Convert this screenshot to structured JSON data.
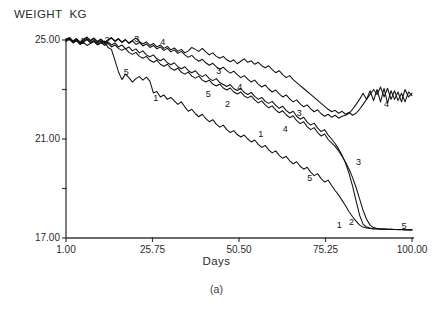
{
  "chart_data": {
    "type": "line",
    "title": "",
    "ylabel": "WEIGHT  KG",
    "xlabel": "Days",
    "caption": "(a)",
    "xlim": [
      1.0,
      100.0
    ],
    "ylim": [
      17.0,
      25.0
    ],
    "xticks": [
      1.0,
      25.75,
      50.5,
      75.25,
      100.0
    ],
    "xtick_labels": [
      "1.00",
      "25.75",
      "50.50",
      "75.25",
      "100.00"
    ],
    "yticks": [
      17.0,
      19.0,
      21.0,
      23.0,
      25.0
    ],
    "ytick_labels": [
      "17.00",
      "",
      "21.00",
      "",
      "25.00"
    ],
    "grid": false,
    "legend": "inline-series-number-labels",
    "line_color": "#111111",
    "background": "#ffffff",
    "series": [
      {
        "name": "1",
        "label": "1",
        "label_points": [
          [
            5.0,
            24.82
          ],
          [
            26.0,
            22.55
          ],
          [
            56.0,
            21.1
          ],
          [
            78.5,
            17.42
          ]
        ],
        "x": [
          1,
          2,
          3,
          4,
          5,
          6,
          7,
          8,
          9,
          10,
          11,
          12,
          13,
          14,
          15,
          16,
          17,
          18,
          19,
          20,
          21,
          22,
          23,
          24,
          25,
          26,
          27,
          28,
          29,
          30,
          31,
          32,
          33,
          34,
          35,
          36,
          37,
          38,
          39,
          40,
          41,
          42,
          43,
          44,
          45,
          46,
          47,
          48,
          49,
          50,
          51,
          52,
          53,
          54,
          55,
          56,
          57,
          58,
          59,
          60,
          61,
          62,
          63,
          64,
          65,
          66,
          67,
          68,
          69,
          70,
          71,
          72,
          73,
          74,
          75,
          76,
          77,
          78,
          79,
          80,
          81,
          82,
          83,
          84,
          85,
          86,
          87,
          88,
          89,
          90,
          91,
          92,
          93,
          94,
          95,
          96,
          97,
          98,
          99,
          100
        ],
        "y": [
          24.95,
          25.02,
          24.88,
          24.97,
          24.82,
          24.9,
          24.78,
          24.86,
          24.94,
          24.8,
          24.88,
          24.96,
          24.7,
          24.62,
          24.18,
          23.72,
          23.4,
          23.62,
          23.48,
          23.3,
          23.44,
          23.52,
          23.38,
          23.5,
          23.34,
          22.86,
          22.92,
          22.7,
          22.78,
          22.6,
          22.68,
          22.54,
          22.4,
          22.5,
          22.3,
          22.12,
          22.2,
          22.02,
          21.9,
          22.0,
          21.82,
          21.7,
          21.78,
          21.6,
          21.48,
          21.56,
          21.38,
          21.26,
          21.34,
          21.18,
          21.08,
          21.16,
          21.0,
          20.88,
          20.96,
          20.78,
          20.66,
          20.74,
          20.56,
          20.44,
          20.52,
          20.34,
          20.22,
          20.3,
          20.12,
          20.0,
          20.08,
          19.9,
          19.78,
          19.86,
          19.66,
          19.52,
          19.6,
          19.4,
          19.26,
          19.34,
          19.12,
          18.92,
          18.74,
          18.52,
          18.3,
          18.06,
          17.86,
          17.68,
          17.52,
          17.44,
          17.4,
          17.38,
          17.36,
          17.36,
          17.35,
          17.35,
          17.34,
          17.34,
          17.34,
          17.33,
          17.33,
          17.33,
          17.32,
          17.32
        ]
      },
      {
        "name": "2",
        "label": "2",
        "label_points": [
          [
            12.0,
            24.88
          ],
          [
            46.5,
            22.3
          ],
          [
            82.0,
            17.52
          ]
        ],
        "x": [
          1,
          2,
          3,
          4,
          5,
          6,
          7,
          8,
          9,
          10,
          11,
          12,
          13,
          14,
          15,
          16,
          17,
          18,
          19,
          20,
          21,
          22,
          23,
          24,
          25,
          26,
          27,
          28,
          29,
          30,
          31,
          32,
          33,
          34,
          35,
          36,
          37,
          38,
          39,
          40,
          41,
          42,
          43,
          44,
          45,
          46,
          47,
          48,
          49,
          50,
          51,
          52,
          53,
          54,
          55,
          56,
          57,
          58,
          59,
          60,
          61,
          62,
          63,
          64,
          65,
          66,
          67,
          68,
          69,
          70,
          71,
          72,
          73,
          74,
          75,
          76,
          77,
          78,
          79,
          80,
          81,
          82,
          83,
          84,
          85,
          86,
          87,
          88,
          89,
          90,
          91,
          92,
          93,
          94,
          95,
          96,
          97,
          98,
          99,
          100
        ],
        "y": [
          24.98,
          25.06,
          24.92,
          25.0,
          24.86,
          24.94,
          25.04,
          24.9,
          24.98,
          24.88,
          24.96,
          24.84,
          24.92,
          24.8,
          24.88,
          24.72,
          24.8,
          24.64,
          24.72,
          24.56,
          24.64,
          24.48,
          24.56,
          24.4,
          24.32,
          24.4,
          24.24,
          24.16,
          24.24,
          24.08,
          24.0,
          24.08,
          23.92,
          23.84,
          23.92,
          23.76,
          23.68,
          23.76,
          23.6,
          23.52,
          23.6,
          23.44,
          23.36,
          23.44,
          23.28,
          23.2,
          23.12,
          23.2,
          23.04,
          22.96,
          23.04,
          22.88,
          22.8,
          22.88,
          22.72,
          22.6,
          22.68,
          22.52,
          22.44,
          22.52,
          22.36,
          22.24,
          22.32,
          22.16,
          22.04,
          22.12,
          21.92,
          21.8,
          21.88,
          21.68,
          21.56,
          21.64,
          21.44,
          21.3,
          21.38,
          21.16,
          21.0,
          20.82,
          20.6,
          20.34,
          20.02,
          19.6,
          19.1,
          18.5,
          17.92,
          17.56,
          17.44,
          17.4,
          17.38,
          17.37,
          17.36,
          17.36,
          17.35,
          17.35,
          17.34,
          17.34,
          17.34,
          17.33,
          17.33,
          17.33
        ]
      },
      {
        "name": "3",
        "label": "3",
        "label_points": [
          [
            20.5,
            24.92
          ],
          [
            44.0,
            23.62
          ],
          [
            67.0,
            21.92
          ],
          [
            84.0,
            19.96
          ]
        ],
        "x": [
          1,
          2,
          3,
          4,
          5,
          6,
          7,
          8,
          9,
          10,
          11,
          12,
          13,
          14,
          15,
          16,
          17,
          18,
          19,
          20,
          21,
          22,
          23,
          24,
          25,
          26,
          27,
          28,
          29,
          30,
          31,
          32,
          33,
          34,
          35,
          36,
          37,
          38,
          39,
          40,
          41,
          42,
          43,
          44,
          45,
          46,
          47,
          48,
          49,
          50,
          51,
          52,
          53,
          54,
          55,
          56,
          57,
          58,
          59,
          60,
          61,
          62,
          63,
          64,
          65,
          66,
          67,
          68,
          69,
          70,
          71,
          72,
          73,
          74,
          75,
          76,
          77,
          78,
          79,
          80,
          81,
          82,
          83,
          84,
          85,
          86,
          87,
          88,
          89,
          90,
          91,
          92,
          93,
          94,
          95,
          96,
          97,
          98,
          99,
          100
        ],
        "y": [
          25.02,
          25.1,
          24.96,
          25.06,
          24.92,
          25.02,
          25.12,
          24.98,
          25.08,
          24.94,
          25.04,
          24.9,
          25.0,
          25.1,
          24.96,
          25.06,
          24.92,
          25.02,
          24.88,
          24.98,
          25.08,
          24.94,
          24.84,
          24.92,
          24.78,
          24.86,
          24.72,
          24.8,
          24.66,
          24.74,
          24.6,
          24.68,
          24.54,
          24.62,
          24.48,
          24.56,
          24.7,
          24.62,
          24.54,
          24.66,
          24.52,
          24.4,
          24.48,
          24.34,
          24.26,
          24.34,
          24.2,
          24.12,
          24.2,
          24.04,
          24.14,
          24.24,
          24.1,
          24.16,
          24.02,
          24.1,
          23.96,
          23.88,
          23.96,
          23.8,
          23.68,
          23.76,
          23.6,
          23.48,
          23.56,
          23.4,
          23.28,
          23.16,
          23.04,
          22.92,
          22.8,
          22.68,
          22.56,
          22.44,
          22.32,
          22.2,
          22.1,
          22.16,
          22.04,
          22.12,
          22.0,
          22.08,
          21.96,
          22.04,
          22.2,
          22.4,
          22.6,
          22.8,
          23.0,
          22.8,
          23.1,
          22.7,
          23.05,
          22.6,
          22.95,
          22.55,
          22.85,
          22.5,
          22.9,
          22.75
        ]
      },
      {
        "name": "4",
        "label": "4",
        "label_points": [
          [
            28.0,
            24.8
          ],
          [
            50.0,
            23.0
          ],
          [
            63.0,
            21.3
          ],
          [
            92.0,
            22.3
          ]
        ],
        "x": [
          1,
          2,
          3,
          4,
          5,
          6,
          7,
          8,
          9,
          10,
          11,
          12,
          13,
          14,
          15,
          16,
          17,
          18,
          19,
          20,
          21,
          22,
          23,
          24,
          25,
          26,
          27,
          28,
          29,
          30,
          31,
          32,
          33,
          34,
          35,
          36,
          37,
          38,
          39,
          40,
          41,
          42,
          43,
          44,
          45,
          46,
          47,
          48,
          49,
          50,
          51,
          52,
          53,
          54,
          55,
          56,
          57,
          58,
          59,
          60,
          61,
          62,
          63,
          64,
          65,
          66,
          67,
          68,
          69,
          70,
          71,
          72,
          73,
          74,
          75,
          76,
          77,
          78,
          79,
          80,
          81,
          82,
          83,
          84,
          85,
          86,
          87,
          88,
          89,
          90,
          91,
          92,
          93,
          94,
          95,
          96,
          97,
          98,
          99,
          100
        ],
        "y": [
          25.0,
          25.08,
          24.94,
          25.04,
          24.9,
          25.0,
          25.1,
          24.96,
          25.06,
          24.92,
          25.02,
          24.88,
          24.98,
          25.08,
          24.94,
          25.04,
          24.9,
          25.0,
          24.86,
          24.96,
          24.82,
          24.9,
          24.76,
          24.84,
          24.7,
          24.78,
          24.64,
          24.72,
          24.58,
          24.66,
          24.52,
          24.6,
          24.46,
          24.54,
          24.4,
          24.3,
          24.38,
          24.24,
          24.14,
          24.22,
          24.08,
          23.98,
          24.06,
          23.92,
          23.82,
          23.9,
          23.76,
          23.66,
          23.74,
          23.6,
          23.48,
          23.56,
          23.42,
          23.3,
          23.38,
          23.22,
          23.1,
          23.18,
          23.02,
          22.9,
          22.98,
          22.82,
          22.7,
          22.78,
          22.62,
          22.5,
          22.58,
          22.42,
          22.3,
          22.38,
          22.22,
          22.1,
          22.18,
          22.02,
          21.92,
          22.0,
          21.88,
          21.96,
          21.84,
          21.92,
          21.96,
          22.04,
          22.2,
          22.4,
          22.6,
          22.85,
          22.6,
          22.95,
          22.55,
          23.0,
          22.5,
          23.05,
          22.45,
          22.95,
          22.6,
          22.9,
          22.5,
          23.0,
          22.7,
          22.85
        ]
      },
      {
        "name": "5",
        "label": "5",
        "label_points": [
          [
            17.5,
            23.6
          ],
          [
            41.0,
            22.7
          ],
          [
            70.0,
            19.3
          ],
          [
            97.0,
            17.38
          ]
        ],
        "x": [
          1,
          2,
          3,
          4,
          5,
          6,
          7,
          8,
          9,
          10,
          11,
          12,
          13,
          14,
          15,
          16,
          17,
          18,
          19,
          20,
          21,
          22,
          23,
          24,
          25,
          26,
          27,
          28,
          29,
          30,
          31,
          32,
          33,
          34,
          35,
          36,
          37,
          38,
          39,
          40,
          41,
          42,
          43,
          44,
          45,
          46,
          47,
          48,
          49,
          50,
          51,
          52,
          53,
          54,
          55,
          56,
          57,
          58,
          59,
          60,
          61,
          62,
          63,
          64,
          65,
          66,
          67,
          68,
          69,
          70,
          71,
          72,
          73,
          74,
          75,
          76,
          77,
          78,
          79,
          80,
          81,
          82,
          83,
          84,
          85,
          86,
          87,
          88,
          89,
          90,
          91,
          92,
          93,
          94,
          95,
          96,
          97,
          98,
          99,
          100
        ],
        "y": [
          24.96,
          25.04,
          24.9,
          24.98,
          24.84,
          24.92,
          25.02,
          24.88,
          24.96,
          24.82,
          24.9,
          24.78,
          24.86,
          24.72,
          24.8,
          24.66,
          24.58,
          24.66,
          24.5,
          24.42,
          24.5,
          24.34,
          24.26,
          24.34,
          24.18,
          24.1,
          24.18,
          24.02,
          23.94,
          24.02,
          23.86,
          23.78,
          23.86,
          23.7,
          23.62,
          23.7,
          23.54,
          23.46,
          23.54,
          23.38,
          23.3,
          23.38,
          23.22,
          23.14,
          23.22,
          23.06,
          22.98,
          23.06,
          22.9,
          22.82,
          22.9,
          22.74,
          22.66,
          22.74,
          22.58,
          22.46,
          22.54,
          22.38,
          22.26,
          22.34,
          22.18,
          22.06,
          22.14,
          21.98,
          21.86,
          21.94,
          21.74,
          21.62,
          21.7,
          21.5,
          21.38,
          21.46,
          21.26,
          21.12,
          21.2,
          20.98,
          20.84,
          20.7,
          20.52,
          20.3,
          20.06,
          19.78,
          19.44,
          19.04,
          18.58,
          18.12,
          17.76,
          17.52,
          17.42,
          17.38,
          17.36,
          17.36,
          17.35,
          17.35,
          17.34,
          17.34,
          17.34,
          17.33,
          17.33,
          17.33
        ]
      }
    ]
  },
  "geometry": {
    "plot_left": 66,
    "plot_right": 412,
    "plot_top": 40,
    "plot_bottom": 238
  }
}
